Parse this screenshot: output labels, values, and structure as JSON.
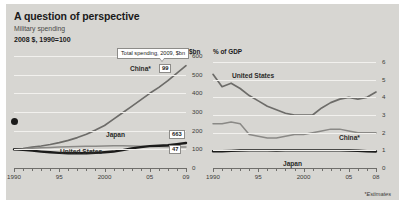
{
  "header": {
    "title": "A question of perspective",
    "subtitle": "Military spending",
    "units": "2008 $, 1990=100"
  },
  "footnote": "*Estimates",
  "annotations": {
    "callout": "Total spending, 2009, $bn"
  },
  "chart_data": [
    {
      "type": "line",
      "id": "left",
      "title": "",
      "xlabel": "",
      "ylabel": "$bn",
      "xlim": [
        1990,
        2009
      ],
      "ylim": [
        0,
        600
      ],
      "yticks": [
        0,
        100,
        200,
        300,
        400,
        500,
        600
      ],
      "ytick_labels": [
        "0",
        "100",
        "200",
        "300",
        "400",
        "500",
        "600"
      ],
      "xticks": [
        1990,
        1995,
        2000,
        2005,
        2009
      ],
      "xtick_labels": [
        "1990",
        "95",
        "2000",
        "05",
        "09"
      ],
      "grid": true,
      "legend": "inline",
      "series": [
        {
          "name": "China*",
          "label": "China*",
          "value_box": "99",
          "x": [
            1990,
            1991,
            1992,
            1993,
            1994,
            1995,
            1996,
            1997,
            1998,
            1999,
            2000,
            2001,
            2002,
            2003,
            2004,
            2005,
            2006,
            2007,
            2008,
            2009
          ],
          "values": [
            100,
            104,
            112,
            118,
            126,
            136,
            148,
            163,
            181,
            203,
            228,
            262,
            296,
            330,
            365,
            400,
            432,
            468,
            508,
            548
          ]
        },
        {
          "name": "Japan",
          "label": "Japan",
          "value_box": "47",
          "x": [
            1990,
            1991,
            1992,
            1993,
            1994,
            1995,
            1996,
            1997,
            1998,
            1999,
            2000,
            2001,
            2002,
            2003,
            2004,
            2005,
            2006,
            2007,
            2008,
            2009
          ],
          "values": [
            100,
            103,
            106,
            108,
            110,
            112,
            114,
            115,
            116,
            117,
            118,
            119,
            119,
            118,
            117,
            116,
            115,
            114,
            113,
            112
          ]
        },
        {
          "name": "United States",
          "label": "United States",
          "value_box": "663",
          "x": [
            1990,
            1991,
            1992,
            1993,
            1994,
            1995,
            1996,
            1997,
            1998,
            1999,
            2000,
            2001,
            2002,
            2003,
            2004,
            2005,
            2006,
            2007,
            2008,
            2009
          ],
          "values": [
            100,
            97,
            93,
            88,
            84,
            81,
            79,
            79,
            79,
            81,
            84,
            88,
            96,
            105,
            112,
            117,
            119,
            122,
            128,
            134
          ]
        }
      ]
    },
    {
      "type": "line",
      "id": "right",
      "title": "",
      "xlabel": "",
      "ylabel": "% of GDP",
      "xlim": [
        1990,
        2008
      ],
      "ylim": [
        0,
        6
      ],
      "yticks": [
        0,
        1,
        2,
        3,
        4,
        5,
        6
      ],
      "ytick_labels": [
        "0",
        "1",
        "2",
        "3",
        "4",
        "5",
        "6"
      ],
      "xticks": [
        1990,
        1995,
        2000,
        2005,
        2008
      ],
      "xtick_labels": [
        "1990",
        "95",
        "2000",
        "05",
        "08"
      ],
      "grid": true,
      "legend": "inline",
      "series": [
        {
          "name": "United States",
          "label": "United States",
          "x": [
            1990,
            1991,
            1992,
            1993,
            1994,
            1995,
            1996,
            1997,
            1998,
            1999,
            2000,
            2001,
            2002,
            2003,
            2004,
            2005,
            2006,
            2007,
            2008
          ],
          "values": [
            5.3,
            4.6,
            4.8,
            4.5,
            4.1,
            3.8,
            3.5,
            3.3,
            3.1,
            3.0,
            3.0,
            3.0,
            3.4,
            3.7,
            3.9,
            4.0,
            3.9,
            4.0,
            4.3
          ]
        },
        {
          "name": "China*",
          "label": "China*",
          "x": [
            1990,
            1991,
            1992,
            1993,
            1994,
            1995,
            1996,
            1997,
            1998,
            1999,
            2000,
            2001,
            2002,
            2003,
            2004,
            2005,
            2006,
            2007,
            2008
          ],
          "values": [
            2.5,
            2.5,
            2.6,
            2.5,
            1.9,
            1.8,
            1.7,
            1.7,
            1.8,
            1.9,
            1.9,
            2.0,
            2.1,
            2.2,
            2.2,
            2.1,
            2.0,
            2.0,
            2.0
          ]
        },
        {
          "name": "Japan",
          "label": "Japan",
          "x": [
            1990,
            1991,
            1992,
            1993,
            1994,
            1995,
            1996,
            1997,
            1998,
            1999,
            2000,
            2001,
            2002,
            2003,
            2004,
            2005,
            2006,
            2007,
            2008
          ],
          "values": [
            0.95,
            0.95,
            0.97,
            0.99,
            1.0,
            1.0,
            1.0,
            0.99,
            1.0,
            1.0,
            1.0,
            1.0,
            1.0,
            1.0,
            1.0,
            0.99,
            0.98,
            0.95,
            0.93
          ]
        }
      ]
    }
  ]
}
